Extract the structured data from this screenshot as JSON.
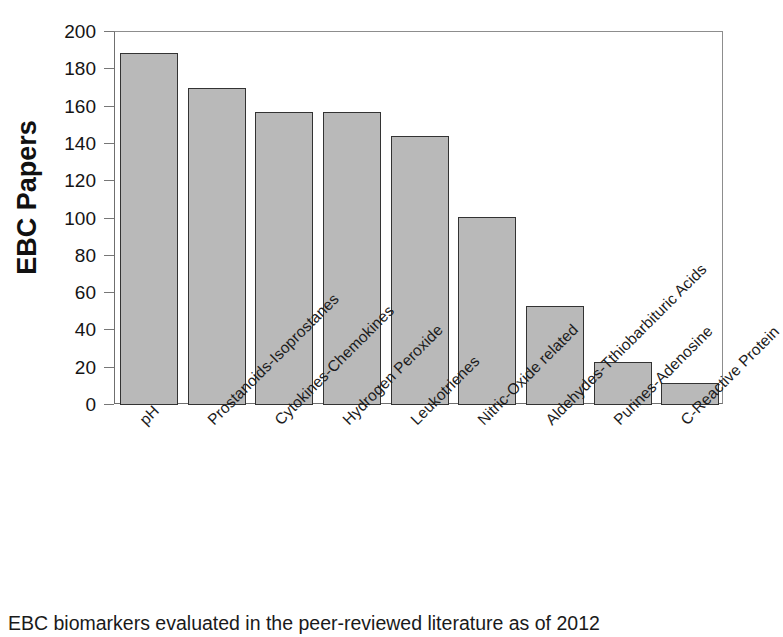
{
  "chart_data": {
    "type": "bar",
    "title": "",
    "xlabel": "",
    "ylabel": "EBC Papers",
    "ylim": [
      0,
      200
    ],
    "ytick_step": 20,
    "yticks": [
      0,
      20,
      40,
      60,
      80,
      100,
      120,
      140,
      160,
      180,
      200
    ],
    "ytick_labels": [
      "0",
      "20",
      "40",
      "60",
      "80",
      "100",
      "120",
      "140",
      "160",
      "180",
      "200"
    ],
    "grid": false,
    "legend": null,
    "bar_color": "#b9b9b9",
    "bar_edge_color": "#333333",
    "categories": [
      "pH",
      "Prostanoids-Isoprostanes",
      "Cytokines-Chemokines",
      "Hydrogen Peroxide",
      "Leukotrienes",
      "Nitric-Oxide related",
      "Aldehydes-Tthiobarbituric Acids",
      "Purines-Adenosine",
      "C-Reactive Protein"
    ],
    "values": [
      189,
      170,
      157,
      157,
      144,
      101,
      53,
      23,
      12
    ],
    "xtick_rotation": -45
  },
  "caption": {
    "text": "EBC biomarkers evaluated in the peer-reviewed literature as of 2012"
  }
}
